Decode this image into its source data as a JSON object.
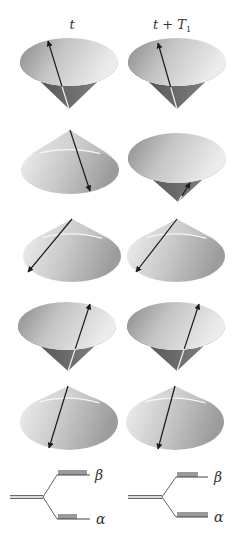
{
  "columns": [
    {
      "label": "t",
      "x": 72
    },
    {
      "label": "t + T",
      "subscript": "1",
      "x": 172
    }
  ],
  "colors": {
    "cone_light": "#e8e8e8",
    "cone_mid": "#b0b0b0",
    "cone_dark": "#6a6a6a",
    "cone_side_dark": "#5c5c5c",
    "arrow": "#1a1a1a",
    "highlight": "#f4f4f4",
    "level_line": "#555555",
    "population_bar": "#9a9a9a"
  },
  "rows": [
    {
      "row": 1,
      "left": {
        "orientation": "apex-down",
        "cx": 69,
        "cy": 62,
        "rx": 49,
        "ry": 24,
        "apex": [
          69,
          109
        ],
        "arrow_from": [
          69,
          109
        ],
        "arrow_to": [
          48,
          41
        ],
        "spin": "up"
      },
      "right": {
        "orientation": "apex-down",
        "cx": 177,
        "cy": 62,
        "rx": 49,
        "ry": 24,
        "apex": [
          177,
          109
        ],
        "arrow_from": [
          177,
          109
        ],
        "arrow_to": [
          158,
          43
        ],
        "spin": "up"
      }
    },
    {
      "row": 2,
      "left": {
        "orientation": "apex-up",
        "cx": 70,
        "cy": 170,
        "rx": 49,
        "ry": 24,
        "apex": [
          70,
          130
        ],
        "arrow_from": [
          70,
          130
        ],
        "arrow_to": [
          90,
          191
        ],
        "spin": "down"
      },
      "right": {
        "orientation": "apex-down",
        "cx": 177,
        "cy": 158,
        "rx": 49,
        "ry": 25,
        "apex": [
          178,
          202
        ],
        "arrow_from": [
          178,
          202
        ],
        "arrow_to": [
          190,
          183
        ],
        "spin": "up"
      }
    },
    {
      "row": 3,
      "left": {
        "orientation": "apex-up",
        "cx": 72,
        "cy": 256,
        "rx": 49,
        "ry": 26,
        "apex": [
          72,
          219
        ],
        "arrow_from": [
          72,
          219
        ],
        "arrow_to": [
          28,
          272
        ],
        "spin": "down"
      },
      "right": {
        "orientation": "apex-up",
        "cx": 176,
        "cy": 256,
        "rx": 49,
        "ry": 26,
        "apex": [
          177,
          219
        ],
        "arrow_from": [
          177,
          219
        ],
        "arrow_to": [
          136,
          272
        ],
        "spin": "down"
      }
    },
    {
      "row": 4,
      "left": {
        "orientation": "apex-down",
        "cx": 67,
        "cy": 326,
        "rx": 49,
        "ry": 24,
        "apex": [
          68,
          371
        ],
        "arrow_from": [
          68,
          371
        ],
        "arrow_to": [
          90,
          304
        ],
        "spin": "up"
      },
      "right": {
        "orientation": "apex-down",
        "cx": 176,
        "cy": 326,
        "rx": 49,
        "ry": 24,
        "apex": [
          177,
          371
        ],
        "arrow_from": [
          177,
          371
        ],
        "arrow_to": [
          199,
          304
        ],
        "spin": "up"
      }
    },
    {
      "row": 5,
      "left": {
        "orientation": "apex-up",
        "cx": 69,
        "cy": 422,
        "rx": 49,
        "ry": 28,
        "apex": [
          68,
          386
        ],
        "arrow_from": [
          68,
          386
        ],
        "arrow_to": [
          49,
          448
        ],
        "spin": "down"
      },
      "right": {
        "orientation": "apex-up",
        "cx": 175,
        "cy": 422,
        "rx": 49,
        "ry": 28,
        "apex": [
          175,
          386
        ],
        "arrow_from": [
          175,
          386
        ],
        "arrow_to": [
          158,
          449
        ],
        "spin": "down"
      }
    }
  ],
  "energy_levels": [
    {
      "position": "left",
      "origin_x": 10,
      "branch_x": 43,
      "mid_y": 497,
      "beta": {
        "y": 475,
        "x_start": 57,
        "x_end": 90,
        "bar_x": 58,
        "bar_w": 29,
        "label": "β",
        "label_x": 95
      },
      "alpha": {
        "y": 519,
        "x_start": 57,
        "x_end": 90,
        "bar_x": 58,
        "bar_w": 19,
        "label": "α",
        "label_x": 96
      }
    },
    {
      "position": "right",
      "origin_x": 128,
      "branch_x": 162,
      "mid_y": 497,
      "beta": {
        "y": 477,
        "x_start": 176,
        "x_end": 208,
        "bar_x": 177,
        "bar_w": 21,
        "label": "β",
        "label_x": 214
      },
      "alpha": {
        "y": 517,
        "x_start": 176,
        "x_end": 208,
        "bar_x": 177,
        "bar_w": 31,
        "label": "α",
        "label_x": 214
      }
    }
  ]
}
